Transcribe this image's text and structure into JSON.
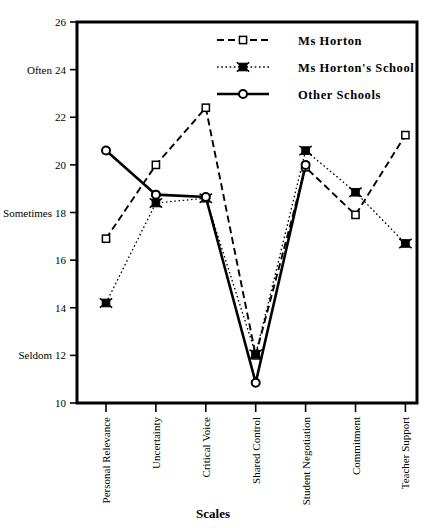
{
  "chart_data": {
    "type": "line",
    "title": "",
    "xlabel": "Scales",
    "ylabel": "",
    "ylim": [
      10,
      26
    ],
    "ytick_step": 2,
    "yticks": [
      10,
      12,
      14,
      16,
      18,
      20,
      22,
      24,
      26
    ],
    "ytick_labels": [
      "10",
      "12",
      "14",
      "16",
      "18",
      "20",
      "22",
      "24",
      "26"
    ],
    "grid": false,
    "legend_position": "top-right-inside",
    "anchor_labels": [
      {
        "text": "Often",
        "value": 24
      },
      {
        "text": "Sometimes",
        "value": 18
      },
      {
        "text": "Seldom",
        "value": 12
      }
    ],
    "categories": [
      "Personal Relevance",
      "Uncertainty",
      "Critical Voice",
      "Shared Control",
      "Student Negotiation",
      "Commitment",
      "Teacher Support"
    ],
    "series": [
      {
        "name": "Ms Horton",
        "values": [
          16.9,
          20.0,
          22.4,
          12.0,
          19.9,
          17.9,
          21.25
        ],
        "line_style": "dashed",
        "marker": "open-square",
        "color": "#000000"
      },
      {
        "name": "Ms Horton's School",
        "values": [
          14.2,
          18.4,
          18.6,
          12.05,
          20.6,
          18.85,
          16.7
        ],
        "line_style": "dotted",
        "marker": "filled-star-square",
        "color": "#000000"
      },
      {
        "name": "Other Schools",
        "values": [
          20.6,
          18.75,
          18.65,
          10.85,
          20.0,
          null,
          null
        ],
        "line_style": "solid",
        "marker": "open-circle",
        "color": "#000000"
      }
    ]
  },
  "legend": {
    "items": [
      {
        "label": "Ms Horton"
      },
      {
        "label": "Ms Horton's School"
      },
      {
        "label": "Other Schools"
      }
    ]
  }
}
